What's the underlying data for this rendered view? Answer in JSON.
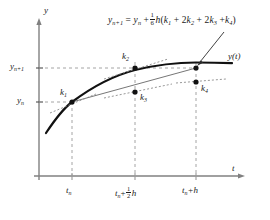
{
  "figure": {
    "title_formula": {
      "lhs": "y",
      "lhs_sub": "n+1",
      "eq": "=",
      "t1": "y",
      "t1_sub": "n",
      "plus1": "+",
      "frac_num": "1",
      "frac_den": "6",
      "h": "h",
      "open": "(",
      "k1": "k",
      "k1_sub": "1",
      "plus2": "+ 2",
      "k2": "k",
      "k2_sub": "2",
      "plus3": "+ 2",
      "k3": "k",
      "k3_sub": "3",
      "plus4": "+",
      "k4": "k",
      "k4_sub": "4",
      "close": ")",
      "full_text": "y_{n+1} = y_n + (1/6) h(k_1 + 2k_2 + 2k_3 + k_4)"
    },
    "axes": {
      "y_axis_label": "y",
      "t_axis_label": "t",
      "y_ticks": [
        {
          "id": "y-n-plus-1",
          "base": "y",
          "sub": "n+1",
          "value_y_px": 68
        },
        {
          "id": "y-n",
          "base": "y",
          "sub": "n",
          "value_y_px": 102
        }
      ],
      "x_ticks": [
        {
          "id": "t-n",
          "base": "t",
          "sub": "n",
          "suffix": "",
          "value_x_px": 72
        },
        {
          "id": "t-n-plus-half-h",
          "base": "t",
          "sub": "n",
          "suffix": "+",
          "frac_num": "1",
          "frac_den": "2",
          "tail": "h",
          "value_x_px": 135
        },
        {
          "id": "t-n-plus-h",
          "base": "t",
          "sub": "n",
          "suffix": "+h",
          "value_x_px": 196
        }
      ]
    },
    "slope_labels": [
      {
        "id": "k1",
        "base": "k",
        "sub": "1",
        "x_px": 60,
        "y_px": 90
      },
      {
        "id": "k2",
        "base": "k",
        "sub": "2",
        "x_px": 123,
        "y_px": 54
      },
      {
        "id": "k3",
        "base": "k",
        "sub": "3",
        "x_px": 139,
        "y_px": 95
      },
      {
        "id": "k4",
        "base": "k",
        "sub": "4",
        "x_px": 200,
        "y_px": 86
      }
    ],
    "solution_curve_label": {
      "base": "y",
      "arg": "(t)",
      "x_px": 229,
      "y_px": 56
    },
    "points": [
      {
        "id": "p-k1",
        "cx": 72,
        "cy": 102,
        "label": "k1"
      },
      {
        "id": "p-k2",
        "cx": 135,
        "cy": 68,
        "label": "k2"
      },
      {
        "id": "p-k3",
        "cx": 135,
        "cy": 92,
        "label": "k3"
      },
      {
        "id": "p-yn1",
        "cx": 196,
        "cy": 68,
        "label": "y_{n+1}"
      },
      {
        "id": "p-k4",
        "cx": 196,
        "cy": 82,
        "label": "k4"
      }
    ],
    "colors": {
      "ink": "#1a1a1a",
      "axis": "#808080",
      "curve": "#111111",
      "secant": "#666666",
      "dashed_guide": "#9a9a9a",
      "dotted_slope": "#8c8c8c",
      "background": "#ffffff"
    }
  }
}
